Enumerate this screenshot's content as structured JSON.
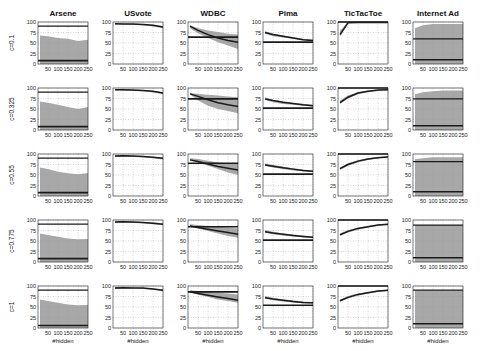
{
  "chart_data": {
    "type": "line",
    "layout": "grid 5 rows x 6 columns of small multiples",
    "columns": [
      "Arsene",
      "USvote",
      "WDBC",
      "Pima",
      "TicTacToe",
      "Internet Ad"
    ],
    "rows": [
      "c=0.1",
      "c=0.325",
      "c=0.55",
      "c=0.775",
      "c=1"
    ],
    "xlabel": "#hidden",
    "ylabel": "",
    "x_ticks": [
      50,
      100,
      150,
      200,
      250
    ],
    "y_ticks": [
      0,
      25,
      50,
      75,
      100
    ],
    "xlim": [
      0,
      250
    ],
    "ylim": [
      0,
      100
    ],
    "grid": true,
    "x": [
      10,
      50,
      100,
      150,
      200,
      250
    ],
    "panels": [
      [
        {
          "dataset": "Arsene",
          "c": "0.1",
          "upper_line": 90,
          "lower_line": 8,
          "band_top": [
            68,
            66,
            62,
            60,
            55,
            58
          ],
          "band_bottom": [
            0,
            0,
            0,
            0,
            0,
            0
          ],
          "mean": null
        },
        {
          "dataset": "USvote",
          "c": "0.1",
          "upper_line": null,
          "lower_line": null,
          "band_top": [
            97,
            96,
            96,
            95,
            93,
            90
          ],
          "band_bottom": [
            94,
            94,
            93,
            92,
            89,
            85
          ],
          "mean": [
            96,
            95,
            95,
            94,
            92,
            88
          ]
        },
        {
          "dataset": "WDBC",
          "c": "0.1",
          "upper_line": null,
          "lower_line": 64,
          "band_top": [
            92,
            85,
            80,
            76,
            72,
            70
          ],
          "band_bottom": [
            85,
            73,
            62,
            52,
            44,
            36
          ],
          "mean": [
            90,
            80,
            70,
            62,
            56,
            52
          ]
        },
        {
          "dataset": "Pima",
          "c": "0.1",
          "upper_line": null,
          "lower_line": 52,
          "band_top": [
            78,
            72,
            68,
            64,
            60,
            58
          ],
          "band_bottom": [
            72,
            66,
            63,
            60,
            57,
            54
          ],
          "mean": [
            75,
            70,
            66,
            62,
            58,
            56
          ]
        },
        {
          "dataset": "TicTacToe",
          "c": "0.1",
          "upper_line": 100,
          "lower_line": null,
          "band_top": [
            80,
            99,
            100,
            100,
            100,
            100
          ],
          "band_bottom": [
            65,
            97,
            99,
            99,
            99,
            99
          ],
          "mean": [
            70,
            98,
            99,
            99,
            99,
            99
          ]
        },
        {
          "dataset": "Internet Ad",
          "c": "0.1",
          "upper_line": 60,
          "lower_line": 10,
          "band_top": [
            85,
            92,
            95,
            95,
            95,
            95
          ],
          "band_bottom": [
            0,
            0,
            0,
            0,
            0,
            0
          ],
          "mean": null
        }
      ],
      [
        {
          "dataset": "Arsene",
          "c": "0.325",
          "upper_line": 90,
          "lower_line": 8,
          "band_top": [
            68,
            65,
            60,
            55,
            50,
            55
          ],
          "band_bottom": [
            0,
            0,
            0,
            0,
            0,
            0
          ],
          "mean": null
        },
        {
          "dataset": "USvote",
          "c": "0.325",
          "upper_line": null,
          "lower_line": null,
          "band_top": [
            97,
            97,
            96,
            95,
            93,
            90
          ],
          "band_bottom": [
            94,
            94,
            93,
            92,
            89,
            85
          ],
          "mean": [
            96,
            96,
            95,
            94,
            92,
            88
          ]
        },
        {
          "dataset": "WDBC",
          "c": "0.325",
          "upper_line": null,
          "lower_line": 74,
          "band_top": [
            88,
            86,
            84,
            82,
            80,
            78
          ],
          "band_bottom": [
            85,
            70,
            58,
            50,
            45,
            40
          ],
          "mean": [
            86,
            80,
            72,
            65,
            60,
            56
          ]
        },
        {
          "dataset": "Pima",
          "c": "0.325",
          "upper_line": null,
          "lower_line": 52,
          "band_top": [
            78,
            72,
            68,
            64,
            62,
            60
          ],
          "band_bottom": [
            72,
            66,
            62,
            60,
            58,
            56
          ],
          "mean": [
            74,
            70,
            66,
            63,
            60,
            58
          ]
        },
        {
          "dataset": "TicTacToe",
          "c": "0.325",
          "upper_line": 100,
          "lower_line": null,
          "band_top": [
            70,
            82,
            90,
            94,
            96,
            97
          ],
          "band_bottom": [
            62,
            75,
            85,
            90,
            93,
            95
          ],
          "mean": [
            65,
            78,
            88,
            92,
            95,
            96
          ]
        },
        {
          "dataset": "Internet Ad",
          "c": "0.325",
          "upper_line": 74,
          "lower_line": 10,
          "band_top": [
            85,
            90,
            92,
            94,
            94,
            94
          ],
          "band_bottom": [
            0,
            0,
            0,
            0,
            0,
            0
          ],
          "mean": null
        }
      ],
      [
        {
          "dataset": "Arsene",
          "c": "0.55",
          "upper_line": 90,
          "lower_line": 8,
          "band_top": [
            68,
            64,
            58,
            54,
            52,
            55
          ],
          "band_bottom": [
            0,
            0,
            0,
            0,
            0,
            0
          ],
          "mean": null
        },
        {
          "dataset": "USvote",
          "c": "0.55",
          "upper_line": null,
          "lower_line": null,
          "band_top": [
            97,
            97,
            96,
            95,
            93,
            91
          ],
          "band_bottom": [
            93,
            94,
            93,
            92,
            90,
            87
          ],
          "mean": [
            95,
            96,
            95,
            94,
            92,
            90
          ]
        },
        {
          "dataset": "WDBC",
          "c": "0.55",
          "upper_line": null,
          "lower_line": 78,
          "band_top": [
            90,
            88,
            84,
            80,
            78,
            76
          ],
          "band_bottom": [
            84,
            80,
            72,
            64,
            56,
            50
          ],
          "mean": [
            86,
            82,
            76,
            70,
            66,
            62
          ]
        },
        {
          "dataset": "Pima",
          "c": "0.55",
          "upper_line": null,
          "lower_line": 52,
          "band_top": [
            78,
            74,
            70,
            66,
            63,
            61
          ],
          "band_bottom": [
            72,
            68,
            64,
            61,
            59,
            57
          ],
          "mean": [
            74,
            71,
            67,
            64,
            61,
            59
          ]
        },
        {
          "dataset": "TicTacToe",
          "c": "0.55",
          "upper_line": 100,
          "lower_line": null,
          "band_top": [
            68,
            78,
            85,
            90,
            93,
            95
          ],
          "band_bottom": [
            62,
            72,
            80,
            86,
            90,
            92
          ],
          "mean": [
            65,
            75,
            83,
            88,
            91,
            93
          ]
        },
        {
          "dataset": "Internet Ad",
          "c": "0.55",
          "upper_line": 82,
          "lower_line": 10,
          "band_top": [
            88,
            90,
            92,
            92,
            92,
            92
          ],
          "band_bottom": [
            0,
            0,
            0,
            0,
            0,
            0
          ],
          "mean": null
        }
      ],
      [
        {
          "dataset": "Arsene",
          "c": "0.775",
          "upper_line": 90,
          "lower_line": 8,
          "band_top": [
            68,
            64,
            60,
            56,
            54,
            55
          ],
          "band_bottom": [
            0,
            0,
            0,
            0,
            0,
            0
          ],
          "mean": null
        },
        {
          "dataset": "USvote",
          "c": "0.775",
          "upper_line": null,
          "lower_line": null,
          "band_top": [
            97,
            97,
            96,
            95,
            94,
            92
          ],
          "band_bottom": [
            93,
            94,
            93,
            92,
            90,
            88
          ],
          "mean": [
            95,
            96,
            95,
            94,
            92,
            90
          ]
        },
        {
          "dataset": "WDBC",
          "c": "0.775",
          "upper_line": null,
          "lower_line": 84,
          "band_top": [
            90,
            88,
            86,
            84,
            82,
            80
          ],
          "band_bottom": [
            84,
            80,
            74,
            68,
            62,
            58
          ],
          "mean": [
            86,
            82,
            78,
            74,
            70,
            66
          ]
        },
        {
          "dataset": "Pima",
          "c": "0.775",
          "upper_line": null,
          "lower_line": 52,
          "band_top": [
            76,
            72,
            68,
            66,
            63,
            61
          ],
          "band_bottom": [
            70,
            66,
            63,
            61,
            59,
            57
          ],
          "mean": [
            72,
            69,
            66,
            63,
            61,
            59
          ]
        },
        {
          "dataset": "TicTacToe",
          "c": "0.775",
          "upper_line": 100,
          "lower_line": null,
          "band_top": [
            68,
            76,
            82,
            86,
            89,
            91
          ],
          "band_bottom": [
            62,
            70,
            77,
            82,
            86,
            88
          ],
          "mean": [
            65,
            73,
            80,
            84,
            88,
            90
          ]
        },
        {
          "dataset": "Internet Ad",
          "c": "0.775",
          "upper_line": 88,
          "lower_line": 10,
          "band_top": [
            88,
            88,
            88,
            88,
            88,
            88
          ],
          "band_bottom": [
            0,
            0,
            0,
            0,
            0,
            0
          ],
          "mean": null
        }
      ],
      [
        {
          "dataset": "Arsene",
          "c": "1",
          "upper_line": 90,
          "lower_line": 6,
          "band_top": [
            68,
            64,
            60,
            56,
            54,
            55
          ],
          "band_bottom": [
            0,
            0,
            0,
            0,
            0,
            0
          ],
          "mean": null
        },
        {
          "dataset": "USvote",
          "c": "1",
          "upper_line": null,
          "lower_line": null,
          "band_top": [
            97,
            97,
            96,
            96,
            94,
            92
          ],
          "band_bottom": [
            93,
            94,
            94,
            93,
            91,
            88
          ],
          "mean": [
            95,
            96,
            95,
            95,
            93,
            90
          ]
        },
        {
          "dataset": "WDBC",
          "c": "1",
          "upper_line": null,
          "lower_line": 86,
          "band_top": [
            90,
            88,
            86,
            84,
            82,
            80
          ],
          "band_bottom": [
            84,
            80,
            74,
            68,
            64,
            60
          ],
          "mean": [
            86,
            82,
            78,
            74,
            70,
            66
          ]
        },
        {
          "dataset": "Pima",
          "c": "1",
          "upper_line": null,
          "lower_line": 54,
          "band_top": [
            76,
            72,
            68,
            66,
            63,
            62
          ],
          "band_bottom": [
            70,
            66,
            63,
            61,
            59,
            58
          ],
          "mean": [
            72,
            69,
            66,
            63,
            61,
            60
          ]
        },
        {
          "dataset": "TicTacToe",
          "c": "1",
          "upper_line": 100,
          "lower_line": null,
          "band_top": [
            68,
            76,
            82,
            86,
            89,
            91
          ],
          "band_bottom": [
            62,
            70,
            77,
            82,
            86,
            88
          ],
          "mean": [
            65,
            73,
            80,
            84,
            88,
            90
          ]
        },
        {
          "dataset": "Internet Ad",
          "c": "1",
          "upper_line": 90,
          "lower_line": 10,
          "band_top": [
            90,
            90,
            90,
            90,
            90,
            90
          ],
          "band_bottom": [
            0,
            0,
            0,
            0,
            0,
            0
          ],
          "mean": null
        }
      ]
    ]
  },
  "style": {
    "band_color": "#a8a8a8",
    "line_color": "#1a1a1a",
    "axis_color": "#222222",
    "grid_color": "#9a9a9a"
  },
  "layout": {
    "col_x": [
      38,
      113,
      188,
      263,
      338,
      413
    ],
    "row_y": [
      22,
      88,
      154,
      220,
      286
    ],
    "plot_w": 50,
    "plot_h": 42
  }
}
